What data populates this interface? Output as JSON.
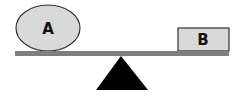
{
  "diagram": {
    "type": "balance-scale",
    "object_a": {
      "label": "A",
      "shape": "ellipse",
      "fill": "#d9d9d9",
      "stroke": "#333333"
    },
    "object_b": {
      "label": "B",
      "shape": "rectangle",
      "fill": "#d9d9d9",
      "stroke": "#333333"
    },
    "beam": {
      "color": "#7f7f7f"
    },
    "fulcrum": {
      "shape": "triangle",
      "color": "#000000"
    }
  }
}
